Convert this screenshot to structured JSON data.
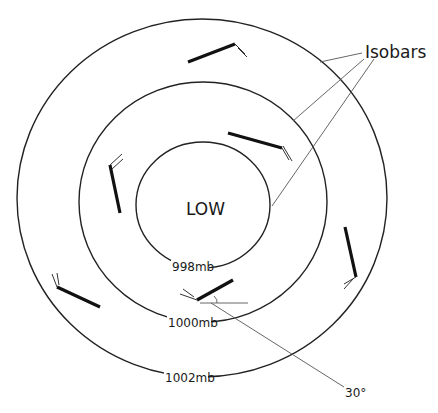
{
  "diagram": {
    "center_label": "LOW",
    "legend_label": "Isobars",
    "angle_label": "30°",
    "isobars": [
      {
        "label": "998mb",
        "cx": 203,
        "cy": 205,
        "rx": 67,
        "ry": 63
      },
      {
        "label": "1000mb",
        "cx": 203,
        "cy": 202,
        "rx": 124,
        "ry": 120
      },
      {
        "label": "1002mb",
        "cx": 202,
        "cy": 198,
        "rx": 185,
        "ry": 179
      }
    ],
    "wind_barbs": [
      {
        "position": "top",
        "x1": 188,
        "y1": 62,
        "x2": 235,
        "y2": 44
      },
      {
        "position": "upper-right",
        "x1": 228,
        "y1": 133,
        "x2": 282,
        "y2": 148
      },
      {
        "position": "left",
        "x1": 120,
        "y1": 213,
        "x2": 110,
        "y2": 165
      },
      {
        "position": "right",
        "x1": 345,
        "y1": 227,
        "x2": 356,
        "y2": 277
      },
      {
        "position": "lower-left",
        "x1": 100,
        "y1": 307,
        "x2": 57,
        "y2": 287
      },
      {
        "position": "bottom",
        "x1": 233,
        "y1": 280,
        "x2": 197,
        "y2": 300
      }
    ],
    "colors": {
      "line": "#222222",
      "leader": "#555555",
      "background": "#ffffff"
    }
  }
}
